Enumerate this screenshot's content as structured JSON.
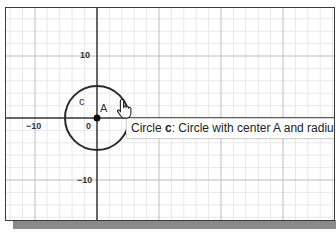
{
  "graph": {
    "axis_labels": {
      "y_pos": "10",
      "y_neg": "−10",
      "x_neg": "−10",
      "origin": "0"
    },
    "objects": {
      "circle_label": "c",
      "point_label": "A"
    },
    "tooltip": {
      "prefix": "Circle ",
      "name": "c",
      "suffix": ": Circle with center A and radius"
    },
    "colors": {
      "grid_minor": "#e6e6e6",
      "grid_major": "#bfbfbf",
      "axis": "#333333",
      "circle": "#2a2a2a",
      "point": "#111111"
    }
  }
}
